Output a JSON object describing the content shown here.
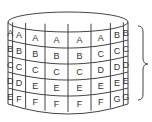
{
  "diagram": {
    "type": "cylinder-grid",
    "rows": 5,
    "columns": 8,
    "grid": [
      [
        "A",
        "A",
        "A",
        "A",
        "A",
        "A",
        "B",
        "B"
      ],
      [
        "B",
        "B",
        "B",
        "B",
        "B",
        "C",
        "C",
        "C"
      ],
      [
        "C",
        "C",
        "C",
        "C",
        "C",
        "D",
        "D",
        "D"
      ],
      [
        "D",
        "D",
        "E",
        "E",
        "E",
        "E",
        "E",
        "E"
      ],
      [
        "E",
        "F",
        "F",
        "F",
        "F",
        "F",
        "G",
        "G"
      ]
    ],
    "brace": "right",
    "colors": {
      "stroke": "#444444",
      "text": "#333333",
      "background": "#ffffff"
    }
  }
}
